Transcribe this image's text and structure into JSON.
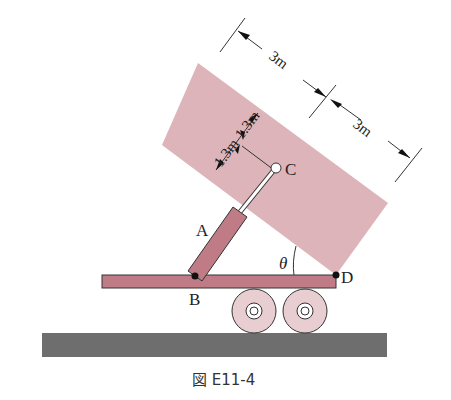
{
  "figure": {
    "caption": "図 E11-4",
    "points": {
      "A": "A",
      "B": "B",
      "C": "C",
      "D": "D"
    },
    "angle_label": "θ",
    "dimensions": {
      "length_1": "3m",
      "length_2": "3m",
      "height_1": "1.3m",
      "height_2": "1.3m"
    },
    "colors": {
      "box_fill": "#dcb4ba",
      "platform_fill": "#c07c86",
      "cylinder_fill": "#c07c86",
      "wheel_fill": "#e8cdd1",
      "ground_fill": "#6e6e6e"
    }
  }
}
